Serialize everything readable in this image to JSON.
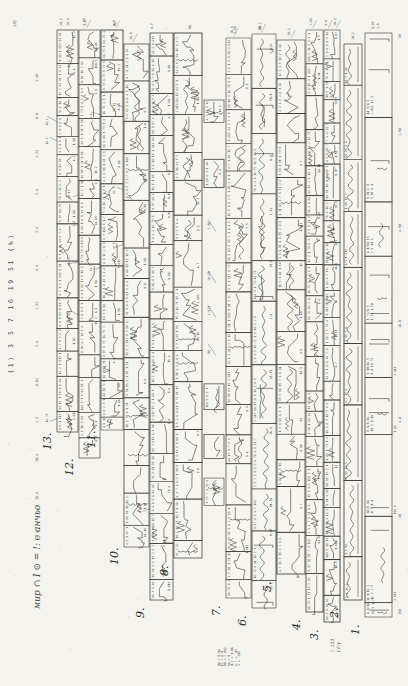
{
  "page": {
    "width": 408,
    "height": 686,
    "bg": "#f4f3ee",
    "paper": "#f7f6f1",
    "ink": "#2a2621",
    "ink_soft": "#4a453d",
    "accent": "#2a2621"
  },
  "header": {
    "vertical_text": "(1) 3 5 7 16 19 51 (%)"
  },
  "handwriting": {
    "symbols_legend": "мир ∩ I ⊙ = !: ℮ анчьо",
    "notes_lines": [
      "96 = 8.96",
      "F2 = 6.4",
      "D4 = 2.613",
      "16 = 8",
      "4.2 = 1.06",
      "5.7 = .45",
      "3 = .395"
    ],
    "strip1_notes": [
      "!. 123",
      "t.t′/γ"
    ]
  },
  "left_ticks": [
    "1.40",
    "8.8",
    "1.73",
    "7.4",
    "7.4",
    "4.4",
    "1.31",
    "7.4",
    "0.81",
    "1.3",
    "78.4",
    "16.2",
    "3.4"
  ],
  "right_ticks": [
    "90",
    "1.50",
    "4.50",
    "16.0",
    "4.8",
    "48",
    "150"
  ],
  "top_ticks": [
    "9.97",
    "1.8",
    "8.0",
    "86",
    "1.5",
    "4.7",
    "4.4",
    "15.2",
    "16.3",
    "18.2",
    "1.15",
    "44.3",
    "16.5",
    "8.5",
    "2.5",
    "1.05"
  ],
  "annotation_pool": [
    "16.5",
    "1.5",
    "8.5",
    "4.5",
    "2.5",
    "166.5",
    "2.613",
    "18.2",
    "16.3",
    "4.4",
    "15.2",
    "9.97",
    "1.8",
    "86",
    "4.7",
    "1.40",
    "8.8",
    "1.73",
    "7.4",
    "0.81",
    "1.31",
    "1.50",
    "6.3",
    "12.2",
    "1.05",
    "16.75",
    "84.15",
    "96.15",
    "78.4",
    "44.5",
    "1.613",
    "8.96",
    "6.4",
    "10.5",
    "13.5",
    "1.66",
    "2.8"
  ],
  "strips": [
    {
      "label": "13.",
      "x": 57,
      "width": 21,
      "top": 30,
      "bottom": 432,
      "style": "dense",
      "seed": 13
    },
    {
      "label": "12.",
      "x": 79,
      "width": 21,
      "top": 30,
      "bottom": 458,
      "style": "dense",
      "seed": 12
    },
    {
      "label": "11.",
      "x": 101,
      "width": 22,
      "top": 30,
      "bottom": 430,
      "style": "dense",
      "seed": 11
    },
    {
      "label": "10.",
      "x": 124,
      "width": 25,
      "top": 44,
      "bottom": 547,
      "style": "med",
      "seed": 10
    },
    {
      "label": "9.",
      "x": 150,
      "width": 23,
      "top": 33,
      "bottom": 600,
      "style": "dense",
      "seed": 9
    },
    {
      "label": "8.",
      "x": 174,
      "width": 28,
      "top": 33,
      "bottom": 558,
      "style": "med",
      "seed": 8
    },
    {
      "label": "",
      "x": 204,
      "width": 20,
      "top": 100,
      "bottom": 520,
      "style": "sparse",
      "seed": 77
    },
    {
      "label": "7.",
      "x": 226,
      "width": 25,
      "top": 38,
      "bottom": 598,
      "style": "med",
      "seed": 7
    },
    {
      "label": "6.",
      "x": 252,
      "width": 24,
      "top": 34,
      "bottom": 608,
      "style": "big",
      "seed": 6
    },
    {
      "label": "5.",
      "x": 277,
      "width": 28,
      "top": 40,
      "bottom": 574,
      "style": "med",
      "seed": 5
    },
    {
      "label": "4.",
      "x": 306,
      "width": 17,
      "top": 30,
      "bottom": 612,
      "style": "dense",
      "seed": 4
    },
    {
      "label": "3.",
      "x": 324,
      "width": 16,
      "top": 30,
      "bottom": 622,
      "style": "dense",
      "seed": 3
    },
    {
      "label": "2.",
      "x": 344,
      "width": 18,
      "top": 44,
      "bottom": 600,
      "style": "wavy",
      "seed": 2
    },
    {
      "label": "1.",
      "x": 365,
      "width": 27,
      "top": 33,
      "bottom": 617,
      "style": "wavywide",
      "seed": 1
    }
  ]
}
